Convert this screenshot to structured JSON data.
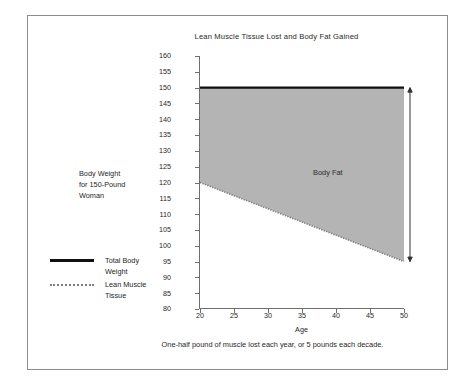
{
  "figure": {
    "title": "Lean Muscle Tissue Lost and Body Fat Gained",
    "caption": "One-half pound of muscle lost each year, or 5 pounds each decade.",
    "side_note_line1": "Body Weight",
    "side_note_line2": "for 150-Pound",
    "side_note_line3": "Woman",
    "area_label": "Body Fat",
    "frame_color": "#8c8c8c",
    "background": "#ffffff"
  },
  "legend": {
    "position": "left",
    "items": [
      {
        "label_line1": "Total Body",
        "label_line2": "Weight",
        "style": "solid",
        "color": "#111111"
      },
      {
        "label_line1": "Lean Muscle",
        "label_line2": "Tissue",
        "style": "dotted",
        "color": "#7d7d7d"
      }
    ]
  },
  "chart_data": {
    "type": "area",
    "title": "Lean Muscle Tissue Lost and Body Fat Gained",
    "subtitle": "",
    "xlabel": "Age",
    "ylabel": "",
    "xlim": [
      20,
      50
    ],
    "ylim": [
      80,
      160
    ],
    "xticks": [
      20,
      25,
      30,
      35,
      40,
      45,
      50
    ],
    "yticks": [
      80,
      85,
      90,
      95,
      100,
      105,
      110,
      115,
      120,
      125,
      130,
      135,
      140,
      145,
      150,
      155,
      160
    ],
    "grid": false,
    "legend_position": "left-outside",
    "x": [
      20,
      25,
      30,
      35,
      40,
      45,
      50
    ],
    "series": [
      {
        "name": "Total Body Weight",
        "style": "solid",
        "color": "#111111",
        "values": [
          150,
          150,
          150,
          150,
          150,
          150,
          150
        ]
      },
      {
        "name": "Lean Muscle Tissue",
        "style": "dotted",
        "color": "#7d7d7d",
        "values": [
          120,
          117.5,
          115,
          112.5,
          110,
          107.5,
          105
        ]
      }
    ],
    "shaded_region": {
      "label": "Body Fat",
      "between": [
        "Total Body Weight",
        "Lean Muscle Tissue"
      ],
      "fill": "#b4b4b4"
    },
    "annotations": [
      {
        "name": "body-fat-range-arrow",
        "type": "double-arrow",
        "x": 50,
        "y_from": 150,
        "y_to": 95
      }
    ],
    "endpoint_values": {
      "lean_muscle_at_20": 120,
      "lean_muscle_at_50": 95,
      "total_body_weight": 150
    }
  }
}
